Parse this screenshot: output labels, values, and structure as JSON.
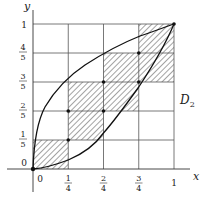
{
  "figure": {
    "region_label": "D",
    "region_subscript": "2",
    "axes": {
      "x_label": "x",
      "y_label": "y"
    },
    "x_ticks": [
      {
        "num": "0",
        "den": ""
      },
      {
        "num": "1",
        "den": "4"
      },
      {
        "num": "2",
        "den": "4"
      },
      {
        "num": "3",
        "den": "4"
      },
      {
        "num": "1",
        "den": ""
      }
    ],
    "y_ticks": [
      {
        "num": "0",
        "den": ""
      },
      {
        "num": "1",
        "den": "5"
      },
      {
        "num": "2",
        "den": "5"
      },
      {
        "num": "3",
        "den": "5"
      },
      {
        "num": "4",
        "den": "5"
      },
      {
        "num": "1",
        "den": ""
      }
    ],
    "grid": {
      "cols": 4,
      "rows": 5
    },
    "shaded_cells": [
      {
        "col": 0,
        "row": 0
      },
      {
        "col": 1,
        "row": 1
      },
      {
        "col": 1,
        "row": 2
      },
      {
        "col": 2,
        "row": 2
      },
      {
        "col": 2,
        "row": 3
      },
      {
        "col": 3,
        "row": 3
      },
      {
        "col": 3,
        "row": 4
      }
    ],
    "curves": [
      {
        "name": "upper",
        "equation": "y = sqrt(x)"
      },
      {
        "name": "lower",
        "equation": "y = x^2"
      }
    ],
    "points": [
      {
        "x": "0",
        "y": "0"
      },
      {
        "x": "1/4",
        "y": "1/5"
      },
      {
        "x": "1/4",
        "y": "2/5"
      },
      {
        "x": "2/4",
        "y": "2/5"
      },
      {
        "x": "2/4",
        "y": "3/5"
      },
      {
        "x": "3/4",
        "y": "3/5"
      },
      {
        "x": "3/4",
        "y": "4/5"
      },
      {
        "x": "1",
        "y": "1"
      }
    ]
  }
}
